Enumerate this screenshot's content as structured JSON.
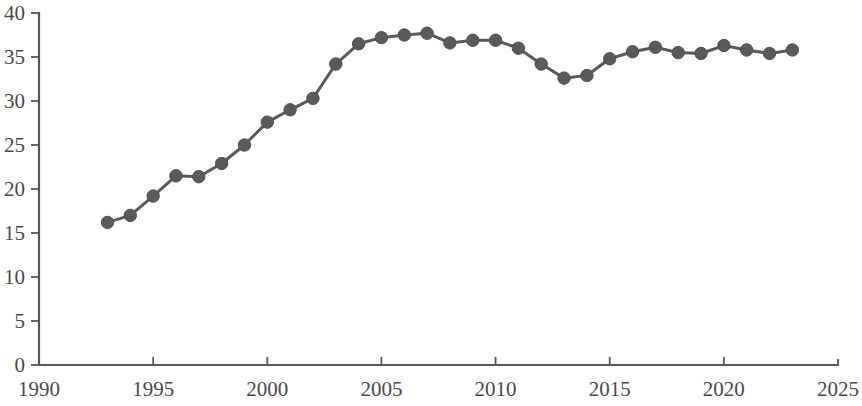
{
  "chart_data": {
    "type": "line",
    "title": "",
    "subtitle": "",
    "xlabel": "",
    "ylabel": "",
    "xlim": [
      1990,
      2025
    ],
    "ylim": [
      0,
      40
    ],
    "grid": false,
    "legend": null,
    "marker": "circle",
    "line_color": "#5a5a5a",
    "marker_color": "#5a5a5a",
    "axis_color": "#565656",
    "background_color": "#ffffff",
    "xticks": [
      1990,
      1995,
      2000,
      2005,
      2010,
      2015,
      2020,
      2025
    ],
    "xtick_labels": [
      "1990",
      "1995",
      "2000",
      "2005",
      "2010",
      "2015",
      "2020",
      "2025"
    ],
    "yticks": [
      0,
      5,
      10,
      15,
      20,
      25,
      30,
      35,
      40
    ],
    "ytick_labels": [
      "0",
      "5",
      "10",
      "15",
      "20",
      "25",
      "30",
      "35",
      "40"
    ],
    "x": [
      1993,
      1994,
      1995,
      1996,
      1997,
      1998,
      1999,
      2000,
      2001,
      2002,
      2003,
      2004,
      2005,
      2006,
      2007,
      2008,
      2009,
      2010,
      2011,
      2012,
      2013,
      2014,
      2015,
      2016,
      2017,
      2018,
      2019,
      2020,
      2021,
      2022,
      2023
    ],
    "values": [
      16.2,
      17.0,
      19.2,
      21.5,
      21.4,
      22.9,
      25.0,
      27.6,
      29.0,
      30.3,
      34.2,
      36.5,
      37.2,
      37.5,
      37.7,
      36.6,
      36.9,
      36.9,
      36.0,
      34.2,
      32.6,
      32.9,
      34.8,
      35.6,
      36.1,
      35.5,
      35.4,
      36.3,
      35.8,
      35.4,
      35.8
    ],
    "series": [
      {
        "name": "series-1",
        "values": [
          16.2,
          17.0,
          19.2,
          21.5,
          21.4,
          22.9,
          25.0,
          27.6,
          29.0,
          30.3,
          34.2,
          36.5,
          37.2,
          37.5,
          37.7,
          36.6,
          36.9,
          36.9,
          36.0,
          34.2,
          32.6,
          32.9,
          34.8,
          35.6,
          36.1,
          35.5,
          35.4,
          36.3,
          35.8,
          35.4,
          35.8
        ]
      }
    ]
  }
}
